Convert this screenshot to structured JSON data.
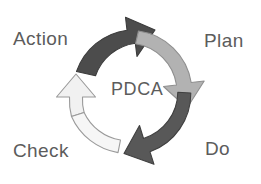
{
  "diagram": {
    "title": "PDCA",
    "center_label": "PDCA",
    "background_color": "#ffffff",
    "text_color": "#5c5c5c",
    "stages": [
      {
        "id": "action",
        "label": "Action",
        "position": "top-left",
        "arrow_color": "#4c4c4c",
        "arrow_outline": "#3b3b3b",
        "arrow_name": "action-to-plan-arrow"
      },
      {
        "id": "plan",
        "label": "Plan",
        "position": "top-right",
        "arrow_color": "#b2b2b2",
        "arrow_outline": "#8f8f8f",
        "arrow_name": "plan-to-do-arrow"
      },
      {
        "id": "do",
        "label": "Do",
        "position": "bottom-right",
        "arrow_color": "#585858",
        "arrow_outline": "#404040",
        "arrow_name": "do-to-check-arrow"
      },
      {
        "id": "check",
        "label": "Check",
        "position": "bottom-left",
        "arrow_color": "#f1f1f1",
        "arrow_outline": "#9a9a9a",
        "arrow_name": "check-to-action-arrow"
      }
    ]
  }
}
